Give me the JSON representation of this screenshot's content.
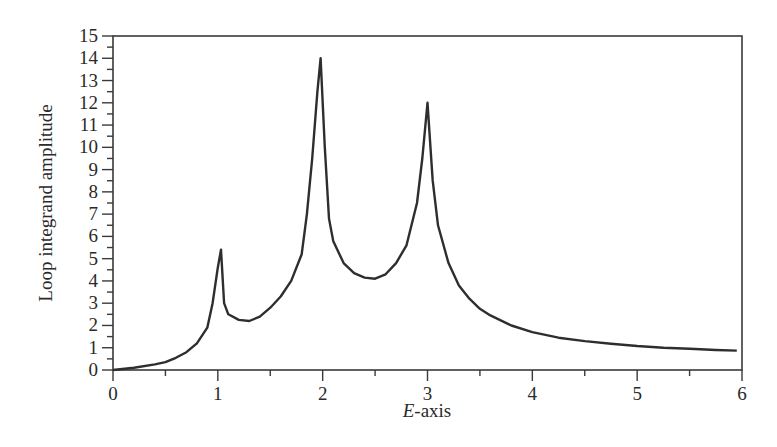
{
  "chart_data": {
    "type": "line",
    "title": "",
    "xlabel_italic": "E",
    "xlabel_rest": "-axis",
    "xlabel": "E-axis",
    "ylabel": "Loop integrand amplitude",
    "xlim": [
      0,
      6
    ],
    "ylim": [
      0,
      15
    ],
    "grid": false,
    "legend": null,
    "x_ticks": [
      0,
      1,
      2,
      3,
      4,
      5,
      6
    ],
    "x_minor_step": 0.5,
    "y_ticks": [
      0,
      1,
      2,
      3,
      4,
      5,
      6,
      7,
      8,
      9,
      10,
      11,
      12,
      13,
      14,
      15
    ],
    "y_minor_step": 0.5,
    "series": [
      {
        "name": "Loop integrand amplitude",
        "color": "#2e2e2e",
        "x": [
          0.0,
          0.2,
          0.4,
          0.5,
          0.6,
          0.7,
          0.8,
          0.9,
          0.95,
          1.0,
          1.03,
          1.06,
          1.1,
          1.2,
          1.3,
          1.4,
          1.5,
          1.6,
          1.7,
          1.8,
          1.85,
          1.9,
          1.95,
          1.98,
          2.02,
          2.06,
          2.1,
          2.2,
          2.3,
          2.4,
          2.5,
          2.6,
          2.7,
          2.8,
          2.9,
          2.95,
          3.0,
          3.05,
          3.1,
          3.2,
          3.3,
          3.4,
          3.5,
          3.6,
          3.8,
          4.0,
          4.25,
          4.5,
          4.75,
          5.0,
          5.25,
          5.5,
          5.75,
          5.95
        ],
        "values": [
          0.0,
          0.1,
          0.25,
          0.35,
          0.55,
          0.8,
          1.2,
          1.9,
          3.0,
          4.6,
          5.4,
          3.0,
          2.5,
          2.25,
          2.2,
          2.4,
          2.8,
          3.3,
          4.0,
          5.2,
          7.0,
          9.5,
          12.5,
          14.0,
          10.0,
          6.8,
          5.8,
          4.8,
          4.35,
          4.15,
          4.1,
          4.3,
          4.8,
          5.6,
          7.5,
          9.5,
          12.0,
          8.5,
          6.5,
          4.8,
          3.8,
          3.2,
          2.75,
          2.45,
          2.0,
          1.7,
          1.45,
          1.3,
          1.18,
          1.08,
          1.0,
          0.95,
          0.9,
          0.87
        ]
      }
    ],
    "annotations": []
  }
}
